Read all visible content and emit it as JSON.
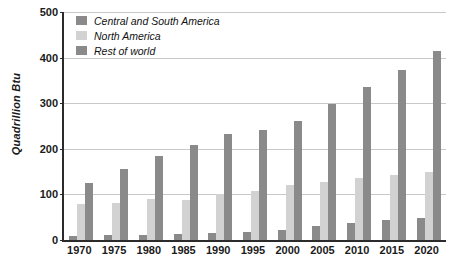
{
  "chart_data": {
    "type": "bar",
    "title": "",
    "xlabel": "",
    "ylabel": "Quadrillion Btu",
    "ylim": [
      0,
      500
    ],
    "yticks": [
      0,
      100,
      200,
      300,
      400,
      500
    ],
    "grid": true,
    "legend_position": "top-left",
    "categories": [
      "1970",
      "1975",
      "1980",
      "1985",
      "1990",
      "1995",
      "2000",
      "2005",
      "2010",
      "2015",
      "2020"
    ],
    "series": [
      {
        "name": "Central and South America",
        "color": "#8a8a8a",
        "values": [
          8,
          10,
          12,
          13,
          15,
          18,
          22,
          30,
          38,
          44,
          48
        ]
      },
      {
        "name": "North America",
        "color": "#d2d2d2",
        "values": [
          78,
          82,
          89,
          87,
          100,
          108,
          120,
          128,
          136,
          143,
          150
        ]
      },
      {
        "name": "Rest of world",
        "color": "#8a8a8a",
        "values": [
          125,
          156,
          184,
          208,
          233,
          241,
          261,
          299,
          336,
          372,
          415
        ]
      }
    ]
  },
  "axis": {
    "y_title": "Quadrillion Btu"
  }
}
